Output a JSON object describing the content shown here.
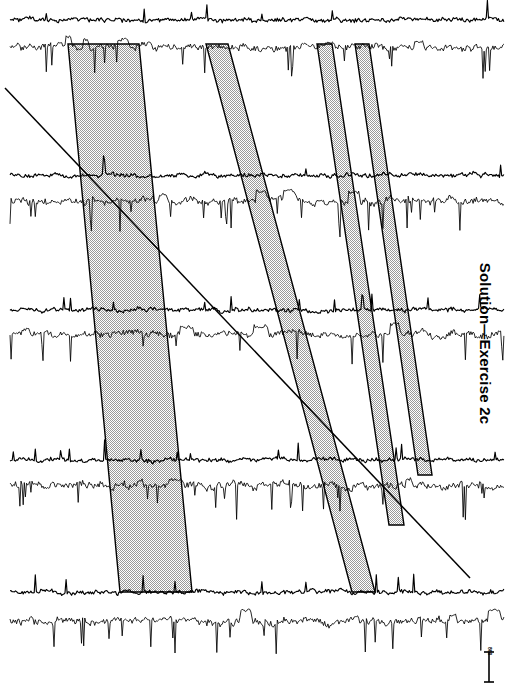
{
  "figure": {
    "title": "Solution—Exercise 2c",
    "caption_position": "right-vertical",
    "background_color": "#ffffff",
    "trace_color": "#000000",
    "band_fill_color": "#d9d9d9",
    "band_stroke_color": "#000000",
    "diagonal_color": "#000000"
  },
  "scale_bar": {
    "label": "800",
    "orientation": "vertical",
    "color": "#000000"
  },
  "chart_data": {
    "type": "line",
    "title": "Solution—Exercise 2c",
    "xlabel": "",
    "ylabel": "",
    "grid": false,
    "legend": "none",
    "xlim": [
      0,
      514
    ],
    "ylim": [
      0,
      687
    ],
    "series": [
      {
        "name": "row-1-eeg",
        "row": 1,
        "channel": "eeg",
        "baseline_y": 20,
        "x_start": 10,
        "x_end": 505,
        "amplitude": 7,
        "spike_density": 0.22,
        "seed": 101
      },
      {
        "name": "row-1-emg",
        "row": 1,
        "channel": "emg",
        "baseline_y": 47,
        "x_start": 10,
        "x_end": 505,
        "amplitude": 11,
        "spike_density": 0.42,
        "seed": 102
      },
      {
        "name": "row-2-eeg",
        "row": 2,
        "channel": "eeg",
        "baseline_y": 175,
        "x_start": 10,
        "x_end": 505,
        "amplitude": 7,
        "spike_density": 0.24,
        "seed": 103
      },
      {
        "name": "row-2-emg",
        "row": 2,
        "channel": "emg",
        "baseline_y": 201,
        "x_start": 10,
        "x_end": 505,
        "amplitude": 12,
        "spike_density": 0.46,
        "seed": 104
      },
      {
        "name": "row-3-eeg",
        "row": 3,
        "channel": "eeg",
        "baseline_y": 310,
        "x_start": 10,
        "x_end": 505,
        "amplitude": 7,
        "spike_density": 0.2,
        "seed": 105
      },
      {
        "name": "row-3-emg",
        "row": 3,
        "channel": "emg",
        "baseline_y": 334,
        "x_start": 10,
        "x_end": 505,
        "amplitude": 11,
        "spike_density": 0.4,
        "seed": 106
      },
      {
        "name": "row-4-eeg",
        "row": 4,
        "channel": "eeg",
        "baseline_y": 460,
        "x_start": 10,
        "x_end": 505,
        "amplitude": 7,
        "spike_density": 0.22,
        "seed": 107
      },
      {
        "name": "row-4-emg",
        "row": 4,
        "channel": "emg",
        "baseline_y": 486,
        "x_start": 10,
        "x_end": 505,
        "amplitude": 12,
        "spike_density": 0.48,
        "seed": 108
      },
      {
        "name": "row-5-eeg",
        "row": 5,
        "channel": "eeg",
        "baseline_y": 592,
        "x_start": 10,
        "x_end": 505,
        "amplitude": 7,
        "spike_density": 0.24,
        "seed": 109
      },
      {
        "name": "row-5-emg",
        "row": 5,
        "channel": "emg",
        "baseline_y": 621,
        "x_start": 10,
        "x_end": 505,
        "amplitude": 12,
        "spike_density": 0.5,
        "seed": 110
      }
    ],
    "bands": [
      {
        "name": "band-1",
        "top_x_left": 68,
        "top_x_right": 139,
        "bottom_x_left": 120,
        "bottom_x_right": 192,
        "y_top": 44,
        "y_bottom": 592
      },
      {
        "name": "band-2",
        "top_x_left": 206,
        "top_x_right": 228,
        "bottom_x_left": 352,
        "bottom_x_right": 375,
        "y_top": 44,
        "y_bottom": 592
      },
      {
        "name": "band-3",
        "top_x_left": 317,
        "top_x_right": 332,
        "bottom_x_left": 389,
        "bottom_x_right": 404,
        "y_top": 44,
        "y_bottom": 525
      },
      {
        "name": "band-4",
        "top_x_left": 355,
        "top_x_right": 369,
        "bottom_x_left": 418,
        "bottom_x_right": 432,
        "y_top": 44,
        "y_bottom": 475
      }
    ],
    "diagonal_line": {
      "name": "reference-diagonal",
      "x1": 5,
      "y1": 88,
      "x2": 470,
      "y2": 578
    }
  }
}
